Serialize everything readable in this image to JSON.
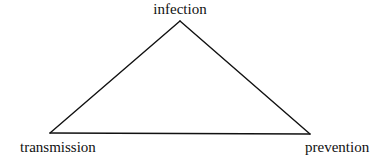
{
  "diagram": {
    "type": "triangle",
    "line_color": "#111111",
    "background": "#ffffff",
    "nodes": [
      {
        "id": "top",
        "label": "infection"
      },
      {
        "id": "left",
        "label": "transmission"
      },
      {
        "id": "right",
        "label": "prevention"
      }
    ],
    "edges": [
      {
        "from": "top",
        "to": "left"
      },
      {
        "from": "left",
        "to": "right"
      },
      {
        "from": "right",
        "to": "top"
      }
    ]
  }
}
